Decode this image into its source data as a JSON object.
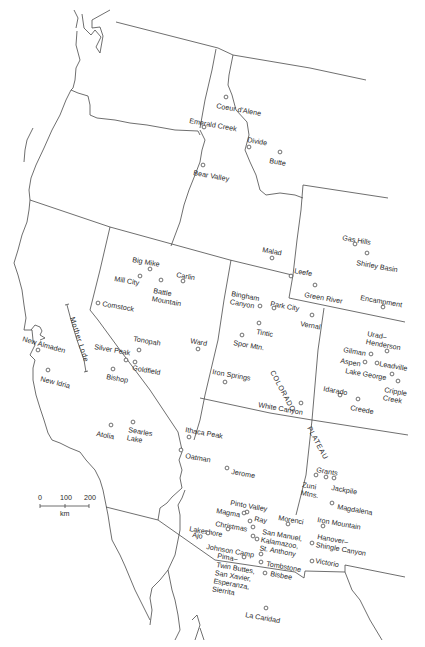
{
  "map": {
    "title": "Western United States mining districts",
    "scale_bar": {
      "ticks": [
        "0",
        "100",
        "200"
      ],
      "unit": "km"
    },
    "regions": [
      {
        "label": "COLORADO",
        "x": 270,
        "y": 372,
        "rotate": 62
      },
      {
        "label": "PLATEAU",
        "x": 307,
        "y": 428,
        "rotate": 62
      },
      {
        "label": "Mother Lode",
        "x": 70,
        "y": 318,
        "rotate": 72
      }
    ],
    "sites": [
      {
        "name": "Coeur d'Alene",
        "lines": [
          "Coeur d'Alene"
        ],
        "cx": 226,
        "cy": 97,
        "lx": 216,
        "ly": 108,
        "rot": 10
      },
      {
        "name": "Emerald Creek",
        "lines": [
          "Emerald Creek"
        ],
        "cx": 204,
        "cy": 127,
        "lx": 189,
        "ly": 123,
        "rot": 10
      },
      {
        "name": "Divide",
        "lines": [
          "Divide"
        ],
        "cx": 249,
        "cy": 147,
        "lx": 247,
        "ly": 142,
        "rot": 10
      },
      {
        "name": "Butte",
        "lines": [
          "Butte"
        ],
        "cx": 280,
        "cy": 152,
        "lx": 269,
        "ly": 163,
        "rot": 10
      },
      {
        "name": "Bear Valley",
        "lines": [
          "Bear Valley"
        ],
        "cx": 203,
        "cy": 165,
        "lx": 193,
        "ly": 175,
        "rot": 10
      },
      {
        "name": "Malad",
        "lines": [
          "Malad"
        ],
        "cx": 272,
        "cy": 258,
        "lx": 262,
        "ly": 252,
        "rot": 10
      },
      {
        "name": "Gas Hills",
        "lines": [
          "Gas Hills"
        ],
        "cx": 355,
        "cy": 244,
        "lx": 342,
        "ly": 240,
        "rot": 10
      },
      {
        "name": "Shirley Basin",
        "lines": [
          "Shirley Basin"
        ],
        "cx": 367,
        "cy": 253,
        "lx": 356,
        "ly": 265,
        "rot": 10
      },
      {
        "name": "Leefe",
        "lines": [
          "Leefe"
        ],
        "cx": 291,
        "cy": 276,
        "lx": 294,
        "ly": 273,
        "rot": 10
      },
      {
        "name": "Green River",
        "lines": [
          "Green River"
        ],
        "cx": 315,
        "cy": 285,
        "lx": 304,
        "ly": 297,
        "rot": 10
      },
      {
        "name": "Encampment",
        "lines": [
          "Encampment"
        ],
        "cx": 383,
        "cy": 307,
        "lx": 360,
        "ly": 300,
        "rot": 10
      },
      {
        "name": "Bingham Canyon",
        "lines": [
          "Bingham",
          "Canyon"
        ],
        "cx": 260,
        "cy": 306,
        "lx": 231,
        "ly": 296,
        "rot": 10
      },
      {
        "name": "Park City",
        "lines": [
          "Park City"
        ],
        "cx": 274,
        "cy": 308,
        "lx": 270,
        "ly": 306,
        "rot": 10
      },
      {
        "name": "Vernal",
        "lines": [
          "Vernal"
        ],
        "cx": 312,
        "cy": 315,
        "lx": 300,
        "ly": 326,
        "rot": 10
      },
      {
        "name": "Big Mike",
        "lines": [
          "Big Mike"
        ],
        "cx": 150,
        "cy": 269,
        "lx": 132,
        "ly": 262,
        "rot": 10
      },
      {
        "name": "Carlin",
        "lines": [
          "Carlin"
        ],
        "cx": 183,
        "cy": 281,
        "lx": 176,
        "ly": 277,
        "rot": 10
      },
      {
        "name": "Mill City",
        "lines": [
          "Mill City"
        ],
        "cx": 140,
        "cy": 276,
        "lx": 114,
        "ly": 281,
        "rot": 10
      },
      {
        "name": "Battle Mountain",
        "lines": [
          "Battle",
          "Mountain"
        ],
        "cx": 161,
        "cy": 280,
        "lx": 153,
        "ly": 293,
        "rot": 10
      },
      {
        "name": "Comstock",
        "lines": [
          "Comstock"
        ],
        "cx": 98,
        "cy": 303,
        "lx": 102,
        "ly": 306,
        "rot": 10
      },
      {
        "name": "Tintic",
        "lines": [
          "Tintic"
        ],
        "cx": 259,
        "cy": 323,
        "lx": 256,
        "ly": 334,
        "rot": 10
      },
      {
        "name": "Spor Mtn.",
        "lines": [
          "Spor Mtn."
        ],
        "cx": 242,
        "cy": 335,
        "lx": 233,
        "ly": 345,
        "rot": 10
      },
      {
        "name": "Ward",
        "lines": [
          "Ward"
        ],
        "cx": 198,
        "cy": 349,
        "lx": 190,
        "ly": 343,
        "rot": 10
      },
      {
        "name": "Iron Springs",
        "lines": [
          "Iron Springs"
        ],
        "cx": 225,
        "cy": 382,
        "lx": 212,
        "ly": 374,
        "rot": 10
      },
      {
        "name": "White Canyon",
        "lines": [
          "White Canyon"
        ],
        "cx": 301,
        "cy": 403,
        "lx": 258,
        "ly": 407,
        "rot": 10
      },
      {
        "name": "Urad-Henderson",
        "lines": [
          "Urad–",
          "Henderson"
        ],
        "cx": 387,
        "cy": 351,
        "lx": 367,
        "ly": 336,
        "rot": 10
      },
      {
        "name": "Gilman",
        "lines": [
          "Gilman"
        ],
        "cx": 371,
        "cy": 354,
        "lx": 343,
        "ly": 352,
        "rot": 10
      },
      {
        "name": "Aspen",
        "lines": [
          "Aspen"
        ],
        "cx": 365,
        "cy": 362,
        "lx": 340,
        "ly": 363,
        "rot": 10
      },
      {
        "name": "Leadville",
        "lines": [
          "Leadville"
        ],
        "cx": 377,
        "cy": 363,
        "lx": 379,
        "ly": 366,
        "rot": 10
      },
      {
        "name": "Lake George",
        "lines": [
          "Lake George"
        ],
        "cx": 392,
        "cy": 374,
        "lx": 345,
        "ly": 373,
        "rot": 10
      },
      {
        "name": "Cripple Creek",
        "lines": [
          "Cripple",
          "Creek"
        ],
        "cx": 398,
        "cy": 381,
        "lx": 384,
        "ly": 392,
        "rot": 10
      },
      {
        "name": "Idarado",
        "lines": [
          "Idarado"
        ],
        "cx": 340,
        "cy": 395,
        "lx": 323,
        "ly": 391,
        "rot": 10
      },
      {
        "name": "Creede",
        "lines": [
          "Creede"
        ],
        "cx": 358,
        "cy": 399,
        "lx": 350,
        "ly": 410,
        "rot": 10
      },
      {
        "name": "Tonopah",
        "lines": [
          "Tonopah"
        ],
        "cx": 139,
        "cy": 350,
        "lx": 133,
        "ly": 341,
        "rot": 10
      },
      {
        "name": "Silver Peak",
        "lines": [
          "Silver Peak"
        ],
        "cx": 126,
        "cy": 360,
        "lx": 94,
        "ly": 349,
        "rot": 10
      },
      {
        "name": "Goldfield",
        "lines": [
          "Goldfield"
        ],
        "cx": 135,
        "cy": 362,
        "lx": 132,
        "ly": 370,
        "rot": 10
      },
      {
        "name": "Bishop",
        "lines": [
          "Bishop"
        ],
        "cx": 113,
        "cy": 369,
        "lx": 106,
        "ly": 379,
        "rot": 10
      },
      {
        "name": "New Almaden",
        "lines": [
          "New Almaden"
        ],
        "cx": 38,
        "cy": 350,
        "lx": 22,
        "ly": 341,
        "rot": 16
      },
      {
        "name": "New Idria",
        "lines": [
          "New Idria"
        ],
        "cx": 48,
        "cy": 370,
        "lx": 40,
        "ly": 381,
        "rot": 14
      },
      {
        "name": "Atolia",
        "lines": [
          "Atolia"
        ],
        "cx": 111,
        "cy": 425,
        "lx": 96,
        "ly": 436,
        "rot": 10
      },
      {
        "name": "Searles Lake",
        "lines": [
          "Searles",
          "Lake"
        ],
        "cx": 133,
        "cy": 422,
        "lx": 128,
        "ly": 432,
        "rot": 10
      },
      {
        "name": "Ithaca Peak",
        "lines": [
          "Ithaca Peak"
        ],
        "cx": 189,
        "cy": 437,
        "lx": 185,
        "ly": 432,
        "rot": 10
      },
      {
        "name": "Oatman",
        "lines": [
          "Oatman"
        ],
        "cx": 181,
        "cy": 450,
        "lx": 185,
        "ly": 458,
        "rot": 10
      },
      {
        "name": "Jerome",
        "lines": [
          "Jerome"
        ],
        "cx": 227,
        "cy": 468,
        "lx": 231,
        "ly": 474,
        "rot": 10
      },
      {
        "name": "Grants",
        "lines": [
          "Grants"
        ],
        "cx": 316,
        "cy": 475,
        "lx": 316,
        "ly": 472,
        "rot": 10
      },
      {
        "name": "Zuni Mtns.",
        "lines": [
          "Zuni",
          "Mtns."
        ],
        "cx": 326,
        "cy": 477,
        "lx": 302,
        "ly": 487,
        "rot": 10
      },
      {
        "name": "Jackpile",
        "lines": [
          "Jackpile"
        ],
        "cx": 334,
        "cy": 478,
        "lx": 331,
        "ly": 490,
        "rot": 10
      },
      {
        "name": "Magdalena",
        "lines": [
          "Magdalena"
        ],
        "cx": 332,
        "cy": 503,
        "lx": 337,
        "ly": 509,
        "rot": 10
      },
      {
        "name": "Pinto Valley",
        "lines": [
          "Pinto Valley"
        ],
        "cx": 247,
        "cy": 512,
        "lx": 230,
        "ly": 505,
        "rot": 10
      },
      {
        "name": "Magma",
        "lines": [
          "Magma"
        ],
        "cx": 244,
        "cy": 513,
        "lx": 216,
        "ly": 513,
        "rot": 10
      },
      {
        "name": "Ray",
        "lines": [
          "Ray"
        ],
        "cx": 250,
        "cy": 521,
        "lx": 254,
        "ly": 521,
        "rot": 10
      },
      {
        "name": "Morenci",
        "lines": [
          "Morenci"
        ],
        "cx": 288,
        "cy": 524,
        "lx": 278,
        "ly": 520,
        "rot": 10
      },
      {
        "name": "Iron Mountain",
        "lines": [
          "Iron Mountain"
        ],
        "cx": 323,
        "cy": 526,
        "lx": 317,
        "ly": 522,
        "rot": 10
      },
      {
        "name": "Christmas",
        "lines": [
          "Christmas"
        ],
        "cx": 253,
        "cy": 527,
        "lx": 215,
        "ly": 526,
        "rot": 10
      },
      {
        "name": "Lakeshore",
        "lines": [
          "Lakeshore"
        ],
        "cx": 228,
        "cy": 529,
        "lx": 189,
        "ly": 531,
        "rot": 10
      },
      {
        "name": "Ajo",
        "lines": [
          "Ajo"
        ],
        "cx": 208,
        "cy": 533,
        "lx": 192,
        "ly": 537,
        "rot": 10
      },
      {
        "name": "San Manuel, Kalamazoo, St. Anthony",
        "lines": [
          "San Manuel,",
          "Kalamazoo,",
          "St. Anthony"
        ],
        "cx": 253,
        "cy": 536,
        "lx": 262,
        "ly": 534,
        "rot": 10
      },
      {
        "name": "Kalamazoo secondary",
        "lines": [],
        "cx": 257,
        "cy": 539,
        "lx": 0,
        "ly": 0,
        "rot": 0
      },
      {
        "name": "Hanover-Shingle Canyon",
        "lines": [
          "Hanover–",
          "Shingle Canyon"
        ],
        "cx": 312,
        "cy": 543,
        "lx": 317,
        "ly": 539,
        "rot": 10
      },
      {
        "name": "Johnson Camp",
        "lines": [
          "Johnson Camp"
        ],
        "cx": 261,
        "cy": 554,
        "lx": 206,
        "ly": 549,
        "rot": 10
      },
      {
        "name": "Pima",
        "lines": [
          "Pima–"
        ],
        "cx": 244,
        "cy": 557,
        "lx": 217,
        "ly": 558,
        "rot": 10
      },
      {
        "name": "Victorio",
        "lines": [
          "Victorio"
        ],
        "cx": 312,
        "cy": 561,
        "lx": 315,
        "ly": 563,
        "rot": 10
      },
      {
        "name": "Tombstone",
        "lines": [
          "Tombstone"
        ],
        "cx": 261,
        "cy": 562,
        "lx": 266,
        "ly": 566,
        "rot": 10
      },
      {
        "name": "Twin Buttes, San Xavier, Esperanza, Sierrita",
        "lines": [
          "Twin Buttes,",
          "San Xavier,",
          "Esperanza,",
          "Sierrita"
        ],
        "cx": 0,
        "cy": 0,
        "lx": 216,
        "ly": 567,
        "rot": 10
      },
      {
        "name": "Bisbee",
        "lines": [
          "Bisbee"
        ],
        "cx": 265,
        "cy": 573,
        "lx": 270,
        "ly": 576,
        "rot": 10
      },
      {
        "name": "La Caridad",
        "lines": [
          "La Caridad"
        ],
        "cx": 266,
        "cy": 608,
        "lx": 245,
        "ly": 617,
        "rot": 10
      }
    ]
  }
}
